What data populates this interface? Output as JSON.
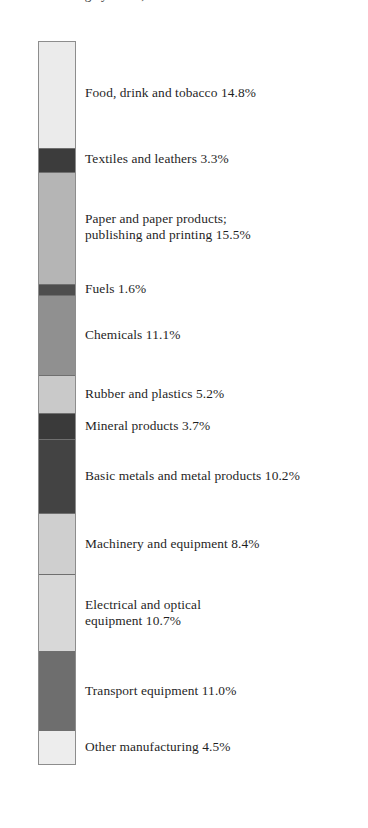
{
  "title_remnant": "Manufacturing by sector, 2004",
  "chart_data": {
    "type": "bar",
    "subtype": "stacked-single-bar",
    "title": "",
    "xlabel": "",
    "ylabel": "",
    "ylim": [
      0,
      100
    ],
    "grid": false,
    "legend": "inline-labels-right",
    "categories": [
      "Food, drink and tobacco",
      "Textiles and leathers",
      "Paper and paper products; publishing and printing",
      "Fuels",
      "Chemicals",
      "Rubber and plastics",
      "Mineral products",
      "Basic metals and metal products",
      "Machinery and equipment",
      "Electrical and optical equipment",
      "Transport equipment",
      "Other manufacturing"
    ],
    "values": [
      14.8,
      3.3,
      15.5,
      1.6,
      11.1,
      5.2,
      3.7,
      10.2,
      8.4,
      10.7,
      11.0,
      4.5
    ],
    "unit": "%",
    "colors": [
      "#ebebeb",
      "#3c3c3c",
      "#b5b5b5",
      "#4e4e4e",
      "#909090",
      "#c9c9c9",
      "#3a3a3a",
      "#434343",
      "#cfcfcf",
      "#d8d8d8",
      "#6e6e6e",
      "#ededed"
    ]
  },
  "segments": [
    {
      "label": "Food, drink and tobacco 14.8%",
      "name": "food-drink-tobacco"
    },
    {
      "label": "Textiles and leathers 3.3%",
      "name": "textiles-leathers"
    },
    {
      "label": "Paper and paper products;\npublishing and printing 15.5%",
      "name": "paper-publishing-printing"
    },
    {
      "label": "Fuels 1.6%",
      "name": "fuels"
    },
    {
      "label": "Chemicals 11.1%",
      "name": "chemicals"
    },
    {
      "label": "Rubber and plastics 5.2%",
      "name": "rubber-plastics"
    },
    {
      "label": "Mineral products 3.7%",
      "name": "mineral-products"
    },
    {
      "label": "Basic metals and metal products 10.2%",
      "name": "basic-metals"
    },
    {
      "label": "Machinery and equipment 8.4%",
      "name": "machinery-equipment"
    },
    {
      "label": "Electrical and optical\nequipment 10.7%",
      "name": "electrical-optical-equipment"
    },
    {
      "label": "Transport equipment 11.0%",
      "name": "transport-equipment"
    },
    {
      "label": "Other manufacturing 4.5%",
      "name": "other-manufacturing"
    }
  ]
}
